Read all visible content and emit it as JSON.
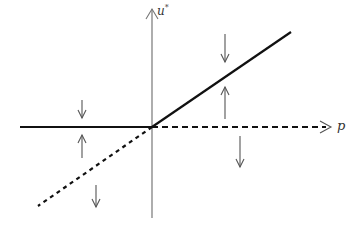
{
  "diagram": {
    "axes": {
      "y_label": "u",
      "y_label_superscript": "*",
      "x_label": "p"
    },
    "colors": {
      "axis": "#777777",
      "solid_branch": "#111111",
      "dashed_branch": "#111111",
      "arrows": "#555555"
    },
    "branches": [
      {
        "name": "stable-left",
        "style": "solid",
        "description": "u* = 0 for p < 0"
      },
      {
        "name": "stable-right",
        "style": "solid",
        "description": "u* = p for p > 0"
      },
      {
        "name": "unstable-left",
        "style": "dotted",
        "description": "u* = p for p < 0"
      },
      {
        "name": "unstable-right",
        "style": "dashed",
        "description": "u* = 0 for p > 0"
      }
    ],
    "flow_arrows": [
      {
        "position": "left-above-zero",
        "direction": "down"
      },
      {
        "position": "left-between",
        "direction": "up"
      },
      {
        "position": "left-below-dotted",
        "direction": "down"
      },
      {
        "position": "right-above-line",
        "direction": "down"
      },
      {
        "position": "right-between",
        "direction": "up"
      },
      {
        "position": "right-below-zero",
        "direction": "down"
      }
    ]
  }
}
